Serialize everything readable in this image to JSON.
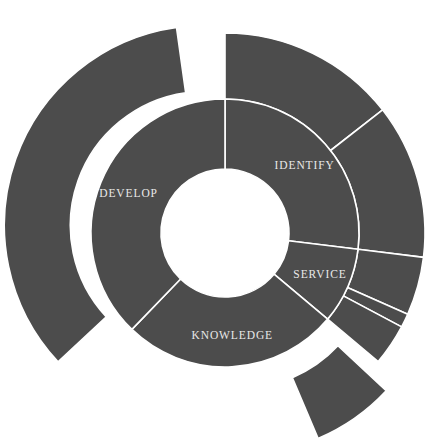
{
  "chart_data": {
    "type": "pie",
    "variant": "sunburst-donut",
    "title": "",
    "subtitle": "",
    "xlabel": "",
    "ylabel": "",
    "legend": [],
    "grid": false,
    "background_color": "#ffffff",
    "segment_color": "#4c4c4c",
    "segment_border_color": "#ffffff",
    "label_color": "#e8e8e8",
    "geometry": {
      "center_x": 225,
      "center_y": 233,
      "inner_hole_radius": 64,
      "inner_ring_outer_radius": 134,
      "outer_ring_outer_radius": 200,
      "start_angle_deg": 0,
      "direction": "clockwise"
    },
    "rings": [
      {
        "name": "inner-ring",
        "level": 1,
        "segments": [
          {
            "label": "IDENTIFY",
            "start_deg": 0,
            "end_deg": 97,
            "value": 27,
            "exploded": false,
            "label_radius": 104,
            "label_angle_deg": 50
          },
          {
            "label": "SERVICE",
            "start_deg": 97,
            "end_deg": 130,
            "value": 9,
            "exploded": false,
            "label_radius": 104,
            "label_angle_deg": 114
          },
          {
            "label": "KNOWLEDGE",
            "start_deg": 130,
            "end_deg": 224,
            "value": 26,
            "exploded": false,
            "label_radius": 104,
            "label_angle_deg": 176
          },
          {
            "label": "DEVELOP",
            "start_deg": 224,
            "end_deg": 360,
            "value": 38,
            "exploded": false,
            "label_radius": 104,
            "label_angle_deg": 292
          }
        ]
      },
      {
        "name": "outer-ring",
        "level": 2,
        "segments": [
          {
            "label": "",
            "parent": "IDENTIFY",
            "start_deg": 0,
            "end_deg": 52,
            "value": 14,
            "exploded": false
          },
          {
            "label": "",
            "parent": "IDENTIFY",
            "start_deg": 52,
            "end_deg": 97,
            "value": 13,
            "exploded": false
          },
          {
            "label": "",
            "parent": "SERVICE",
            "start_deg": 97,
            "end_deg": 114,
            "value": 5,
            "exploded": false
          },
          {
            "label": "",
            "parent": "SERVICE",
            "start_deg": 114,
            "end_deg": 118,
            "value": 1,
            "exploded": false
          },
          {
            "label": "",
            "parent": "SERVICE",
            "start_deg": 118,
            "end_deg": 130,
            "value": 3,
            "exploded": false
          },
          {
            "label": "",
            "parent": "KNOWLEDGE",
            "start_deg": 133,
            "end_deg": 157,
            "value": 7,
            "exploded": true,
            "explode_offset": 26,
            "explode_angle_deg": 145
          },
          {
            "label": "",
            "parent": "DEVELOP",
            "start_deg": 227,
            "end_deg": 352,
            "value": 35,
            "exploded": true,
            "explode_offset": 22,
            "explode_angle_deg": 290
          }
        ]
      }
    ]
  }
}
